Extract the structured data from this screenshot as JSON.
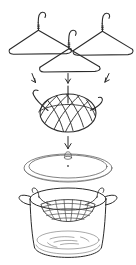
{
  "figure": {
    "title": "Wire hangers converted into a steamer basket inside a covered pot",
    "style": "black and white line drawing",
    "background_color": "#ffffff",
    "ink_color": "#2b2b2b",
    "light_ink_color": "#6e6e6e",
    "width": 136,
    "height": 265
  },
  "steps": [
    {
      "index": 1,
      "name": "hangers",
      "label": "Three wire clothes hangers",
      "items": [
        {
          "name": "hanger-left",
          "label": "Wire hanger (left)"
        },
        {
          "name": "hanger-center",
          "label": "Wire hanger (center)"
        },
        {
          "name": "hanger-right",
          "label": "Wire hanger (right)"
        }
      ]
    },
    {
      "index": 2,
      "name": "basket",
      "label": "Woven wire mesh steamer basket",
      "parts": [
        {
          "name": "basket-dome",
          "label": "Oval woven dome"
        },
        {
          "name": "basket-hook-left",
          "label": "Left hanging hook"
        },
        {
          "name": "basket-hook-right",
          "label": "Right hanging hook"
        },
        {
          "name": "basket-stem",
          "label": "Center wire stem"
        }
      ]
    },
    {
      "index": 3,
      "name": "pot",
      "label": "Cooking pot with lid and water",
      "parts": [
        {
          "name": "pot-lid",
          "label": "Pot lid with knob"
        },
        {
          "name": "lid-knob",
          "label": "Lid knob"
        },
        {
          "name": "pot-body",
          "label": "Pot body"
        },
        {
          "name": "pot-rim",
          "label": "Pot rim"
        },
        {
          "name": "water-surface",
          "label": "Water in bottom of pot"
        },
        {
          "name": "basket-in-pot",
          "label": "Basket resting on pot rim"
        }
      ]
    }
  ],
  "arrows": {
    "to_basket": [
      {
        "name": "arrow-hanger-left-down",
        "direction": "down-right"
      },
      {
        "name": "arrow-hanger-center-down",
        "direction": "down"
      },
      {
        "name": "arrow-hanger-right-down",
        "direction": "down-left"
      }
    ],
    "to_pot": [
      {
        "name": "arrow-basket-to-pot",
        "direction": "down"
      }
    ]
  }
}
